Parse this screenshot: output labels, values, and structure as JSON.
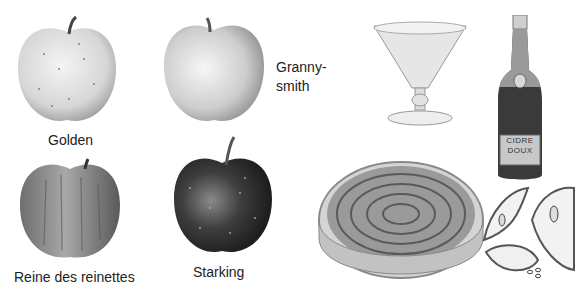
{
  "apples": [
    {
      "name": "Golden",
      "tone": "#d9d9d9"
    },
    {
      "name": "Granny-smith",
      "line1": "Granny-",
      "line2": "smith",
      "tone": "#cfcfcf"
    },
    {
      "name": "Reine des reinettes",
      "tone": "#8a8a8a"
    },
    {
      "name": "Starking",
      "tone": "#3c3c3c"
    }
  ],
  "bottle": {
    "label_line1": "CIDRE",
    "label_line2": "DOUX"
  },
  "items": {
    "glass": "cider-glass",
    "tart": "apple-tart",
    "slices": "apple-halves"
  }
}
